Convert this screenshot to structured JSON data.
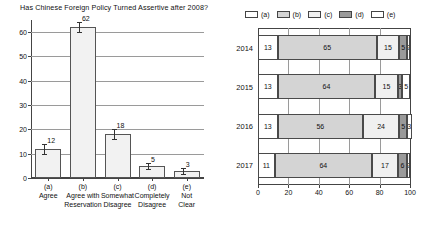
{
  "chart_data": [
    {
      "type": "bar",
      "id": "left-bar-chart",
      "title": "Has Chinese Foreign Policy Turned Assertive after 2008?",
      "xlabel": "",
      "ylabel": "",
      "ylim": [
        0,
        65
      ],
      "yticks": [
        0,
        10,
        20,
        30,
        40,
        50,
        60
      ],
      "grid": true,
      "legend": "none",
      "categories": [
        "(a)",
        "(b)",
        "(c)",
        "(d)",
        "(e)"
      ],
      "category_labels": [
        [
          "(a)",
          "Agree"
        ],
        [
          "(b)",
          "Agree with",
          "Reservation"
        ],
        [
          "(c)",
          "Somewhat",
          "Disagree"
        ],
        [
          "(d)",
          "Completely",
          "Disagree"
        ],
        [
          "(e)",
          "Not",
          "Clear"
        ]
      ],
      "values": [
        12,
        62,
        18,
        5,
        3
      ],
      "value_labels": [
        "12",
        "62",
        "18",
        "5",
        "3"
      ],
      "errors": [
        2,
        2,
        2,
        1.2,
        1.2
      ],
      "bar_fill": "#f2f2f2",
      "bar_stroke": "#555555"
    },
    {
      "type": "bar",
      "id": "right-stacked-chart",
      "orientation": "horizontal",
      "stacked": true,
      "xlim": [
        0,
        100
      ],
      "xticks": [
        0,
        20,
        40,
        60,
        80,
        100
      ],
      "xtick_labels": [
        "0",
        "20",
        "40",
        "60",
        "80",
        "100"
      ],
      "grid": true,
      "legend_position": "top",
      "legend": [
        "(a)",
        "(b)",
        "(c)",
        "(d)",
        "(e)"
      ],
      "legend_colors": [
        "#ffffff",
        "#d4d4d4",
        "#f0f0f0",
        "#9a9a9a",
        "#ffffff"
      ],
      "categories": [
        "2014",
        "2015",
        "2016",
        "2017"
      ],
      "series": [
        {
          "name": "(a)",
          "values": [
            13,
            13,
            13,
            11
          ],
          "color": "#ffffff"
        },
        {
          "name": "(b)",
          "values": [
            65,
            64,
            56,
            64
          ],
          "color": "#d4d4d4"
        },
        {
          "name": "(c)",
          "values": [
            15,
            15,
            24,
            17
          ],
          "color": "#f0f0f0"
        },
        {
          "name": "(d)",
          "values": [
            5,
            3,
            5,
            6
          ],
          "color": "#9a9a9a"
        },
        {
          "name": "(e)",
          "values": [
            2,
            5,
            3,
            2
          ],
          "color": "#ffffff"
        }
      ]
    }
  ]
}
